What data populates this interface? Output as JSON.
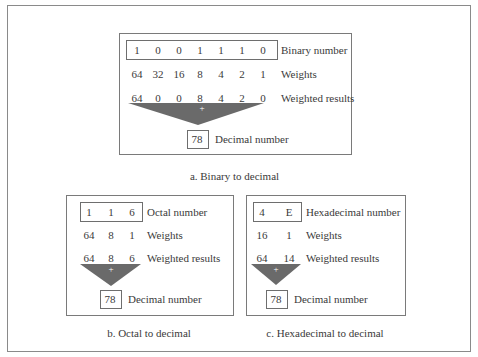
{
  "figure": {
    "panels": [
      {
        "id": "binary",
        "caption": "a. Binary to decimal",
        "number_label": "Binary number",
        "weights_label": "Weights",
        "results_label": "Weighted results",
        "decimal_label": "Decimal number",
        "digits": [
          "1",
          "0",
          "0",
          "1",
          "1",
          "1",
          "0"
        ],
        "weights": [
          "64",
          "32",
          "16",
          "8",
          "4",
          "2",
          "1"
        ],
        "results": [
          "64",
          "0",
          "0",
          "8",
          "4",
          "2",
          "0"
        ],
        "sum_symbol": "+",
        "decimal": "78"
      },
      {
        "id": "octal",
        "caption": "b. Octal to decimal",
        "number_label": "Octal number",
        "weights_label": "Weights",
        "results_label": "Weighted results",
        "decimal_label": "Decimal number",
        "digits": [
          "1",
          "1",
          "6"
        ],
        "weights": [
          "64",
          "8",
          "1"
        ],
        "results": [
          "64",
          "8",
          "6"
        ],
        "sum_symbol": "+",
        "decimal": "78"
      },
      {
        "id": "hex",
        "caption": "c. Hexadecimal to decimal",
        "number_label": "Hexadecimal number",
        "weights_label": "Weights",
        "results_label": "Weighted results",
        "decimal_label": "Decimal number",
        "digits": [
          "4",
          "E"
        ],
        "weights": [
          "16",
          "1"
        ],
        "results": [
          "64",
          "14"
        ],
        "sum_symbol": "+",
        "decimal": "78"
      }
    ],
    "colors": {
      "triangle": "#6a6a6a",
      "text": "#3a3a3a",
      "border": "#7a7a7a"
    }
  }
}
